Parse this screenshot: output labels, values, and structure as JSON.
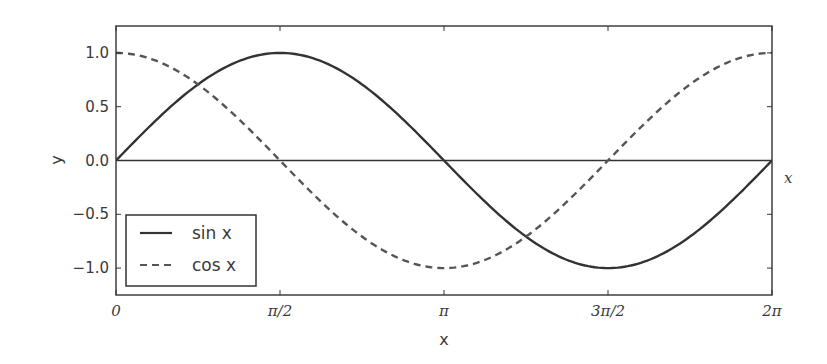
{
  "chart_data": {
    "type": "line",
    "title": "",
    "xlabel": "x",
    "ylabel": "y",
    "xlim": [
      0,
      6.283185307
    ],
    "ylim": [
      -1.25,
      1.25
    ],
    "grid": false,
    "legend_position": "lower left",
    "x_ticks": [
      {
        "value": 0,
        "label": "0"
      },
      {
        "value": 1.5707963,
        "label": "π/2"
      },
      {
        "value": 3.1415927,
        "label": "π"
      },
      {
        "value": 4.712389,
        "label": "3π/2"
      },
      {
        "value": 6.2831853,
        "label": "2π"
      }
    ],
    "y_ticks": [
      {
        "value": 1.0,
        "label": "1.0"
      },
      {
        "value": 0.5,
        "label": "0.5"
      },
      {
        "value": 0.0,
        "label": "0.0"
      },
      {
        "value": -0.5,
        "label": "−0.5"
      },
      {
        "value": -1.0,
        "label": "−1.0"
      }
    ],
    "annotations": [
      {
        "text": "x",
        "position": "right of x-axis at y=0",
        "style": "italic"
      }
    ],
    "reference_lines": [
      {
        "orientation": "horizontal",
        "y": 0
      }
    ],
    "series": [
      {
        "name": "sin x",
        "style": "solid",
        "color": "#333333",
        "x": [
          0,
          0.7854,
          1.5708,
          2.3562,
          3.1416,
          3.927,
          4.7124,
          5.4978,
          6.2832
        ],
        "values": [
          0,
          0.7071,
          1.0,
          0.7071,
          0,
          -0.7071,
          -1.0,
          -0.7071,
          0
        ]
      },
      {
        "name": "cos x",
        "style": "dashed",
        "color": "#555555",
        "x": [
          0,
          0.7854,
          1.5708,
          2.3562,
          3.1416,
          3.927,
          4.7124,
          5.4978,
          6.2832
        ],
        "values": [
          1.0,
          0.7071,
          0,
          -0.7071,
          -1.0,
          -0.7071,
          0,
          0.7071,
          1.0
        ]
      }
    ]
  },
  "legend": {
    "items": [
      {
        "label": "sin x"
      },
      {
        "label": "cos x"
      }
    ]
  },
  "axes": {
    "xlabel": "x",
    "ylabel": "y",
    "x_annotation": "x"
  },
  "colors": {
    "axis": "#333333",
    "sin": "#333333",
    "cos": "#555555",
    "text": "#3a3a3a"
  }
}
